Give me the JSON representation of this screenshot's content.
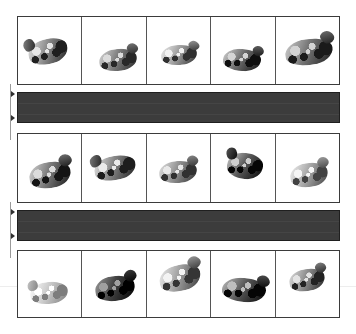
{
  "figure": {
    "kind": "image-strip-panel",
    "background_color": "#ffffff",
    "canvas": {
      "width": 356,
      "height": 334
    },
    "grid": {
      "left": 17,
      "right": 340,
      "columns": 5,
      "column_dividers_x": [
        82,
        147,
        208,
        273
      ],
      "border_color": "#3b3b3b",
      "divider_color": "#555555",
      "cell_background": "#ffffff"
    },
    "rows": [
      {
        "id": "row-1",
        "label": "top-strip",
        "top": 16,
        "bottom": 85,
        "cells": [
          {
            "id": "r1c1",
            "content": "hand-photo",
            "tone": "#8a8a8a",
            "dark": "#2c2c2c",
            "light": "#d8d8d8",
            "cx": 46,
            "cy": 50,
            "w": 40,
            "h": 25,
            "rot": -14,
            "thumb": "upper-left"
          },
          {
            "id": "r1c2",
            "content": "hand-photo",
            "tone": "#7d7d7d",
            "dark": "#333333",
            "light": "#cfcfcf",
            "cx": 55,
            "cy": 62,
            "w": 38,
            "h": 22,
            "rot": -6,
            "thumb": "upper-right"
          },
          {
            "id": "r1c3",
            "content": "hand-photo",
            "tone": "#9b9b9b",
            "dark": "#3a3a3a",
            "light": "#e2e2e2",
            "cx": 50,
            "cy": 55,
            "w": 36,
            "h": 20,
            "rot": -4,
            "thumb": "upper-right"
          },
          {
            "id": "r1c4",
            "content": "hand-photo",
            "tone": "#6f6f6f",
            "dark": "#1e1e1e",
            "light": "#cacaca",
            "cx": 48,
            "cy": 62,
            "w": 38,
            "h": 22,
            "rot": 4,
            "thumb": "upper-right"
          },
          {
            "id": "r1c5",
            "content": "hand-photo",
            "tone": "#767676",
            "dark": "#272727",
            "light": "#c8c8c8",
            "cx": 52,
            "cy": 50,
            "w": 48,
            "h": 26,
            "rot": -8,
            "thumb": "upper-right"
          }
        ]
      },
      {
        "id": "row-2",
        "label": "middle-strip",
        "top": 133,
        "bottom": 203,
        "cells": [
          {
            "id": "r2c1",
            "content": "hand-photo",
            "tone": "#7a7a7a",
            "dark": "#222222",
            "light": "#d0d0d0",
            "cx": 50,
            "cy": 58,
            "w": 42,
            "h": 26,
            "rot": -10,
            "thumb": "upper-right"
          },
          {
            "id": "r2c2",
            "content": "hand-photo",
            "tone": "#838383",
            "dark": "#2a2a2a",
            "light": "#dcdcdc",
            "cx": 50,
            "cy": 48,
            "w": 42,
            "h": 24,
            "rot": -12,
            "thumb": "upper-left"
          },
          {
            "id": "r2c3",
            "content": "hand-photo",
            "tone": "#8e8e8e",
            "dark": "#3b3b3b",
            "light": "#dadada",
            "cx": 48,
            "cy": 54,
            "w": 38,
            "h": 22,
            "rot": -5,
            "thumb": "upper-right"
          },
          {
            "id": "r2c4",
            "content": "hand-photo",
            "tone": "#5f5f5f",
            "dark": "#161616",
            "light": "#c4c4c4",
            "cx": 52,
            "cy": 45,
            "w": 36,
            "h": 26,
            "rot": 6,
            "thumb": "upper-left"
          },
          {
            "id": "r2c5",
            "content": "hand-photo",
            "tone": "#a2a2a2",
            "dark": "#4a4a4a",
            "light": "#e6e6e6",
            "cx": 52,
            "cy": 58,
            "w": 38,
            "h": 24,
            "rot": -8,
            "thumb": "upper-right"
          }
        ]
      },
      {
        "id": "row-3",
        "label": "bottom-strip",
        "top": 250,
        "bottom": 318,
        "cells": [
          {
            "id": "r3c1",
            "content": "hand-photo",
            "tone": "#c0c0c0",
            "dark": "#7d7d7d",
            "light": "#efefef",
            "cx": 48,
            "cy": 62,
            "w": 38,
            "h": 22,
            "rot": -6,
            "thumb": "upper-left"
          },
          {
            "id": "r3c2",
            "content": "hand-photo",
            "tone": "#4a4a4a",
            "dark": "#0f0f0f",
            "light": "#9c9c9c",
            "cx": 50,
            "cy": 55,
            "w": 40,
            "h": 25,
            "rot": -8,
            "thumb": "upper-right"
          },
          {
            "id": "r3c3",
            "content": "hand-photo",
            "tone": "#9c9c9c",
            "dark": "#3f3f3f",
            "light": "#e4e4e4",
            "cx": 52,
            "cy": 40,
            "w": 42,
            "h": 26,
            "rot": -14,
            "thumb": "upper-right"
          },
          {
            "id": "r3c4",
            "content": "hand-photo",
            "tone": "#5c5c5c",
            "dark": "#151515",
            "light": "#b6b6b6",
            "cx": 50,
            "cy": 58,
            "w": 44,
            "h": 24,
            "rot": 5,
            "thumb": "upper-right"
          },
          {
            "id": "r3c5",
            "content": "hand-photo",
            "tone": "#8b8b8b",
            "dark": "#2e2e2e",
            "light": "#d6d6d6",
            "cx": 48,
            "cy": 42,
            "w": 36,
            "h": 22,
            "rot": -10,
            "thumb": "upper-right"
          }
        ]
      }
    ],
    "dark_bars": [
      {
        "id": "bar-1",
        "left": 17,
        "top": 92,
        "width": 323,
        "height": 31,
        "fill_color": "#3c3c3c",
        "border_color": "#1f1f1f"
      },
      {
        "id": "bar-2",
        "left": 17,
        "top": 210,
        "width": 323,
        "height": 31,
        "fill_color": "#3c3c3c",
        "border_color": "#1f1f1f"
      }
    ],
    "measure_lines": [
      {
        "id": "measure-1",
        "x": 10,
        "top": 84,
        "bottom": 140,
        "line_color": "#9a9a9a",
        "ticks": [
          {
            "y": 94
          },
          {
            "y": 118
          }
        ]
      },
      {
        "id": "measure-2",
        "x": 10,
        "top": 202,
        "bottom": 258,
        "line_color": "#9a9a9a",
        "ticks": [
          {
            "y": 212
          },
          {
            "y": 236
          }
        ]
      }
    ],
    "faint_rules": [
      {
        "id": "faint-rule-1",
        "y": 286,
        "color": "#ededed"
      }
    ]
  }
}
